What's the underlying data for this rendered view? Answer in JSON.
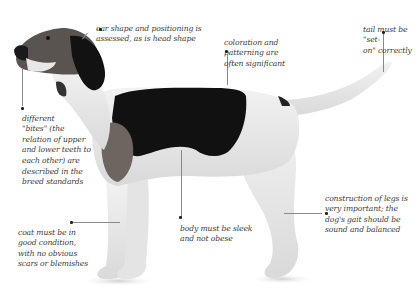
{
  "image": {
    "subject": "hound dog in profile, black-and-white tricolor coat, with breed-standard annotations",
    "background": "#ffffff"
  },
  "annotations": [
    {
      "id": "ear-shape",
      "text": "ear shape and positioning is\nassessed, as is head shape"
    },
    {
      "id": "coloration",
      "text": "coloration and\npatterning are\noften significant"
    },
    {
      "id": "tail",
      "text": "tail must be \"set-\non\" correctly"
    },
    {
      "id": "bites",
      "text": "different\n\"bites\" (the\nrelation of upper\nand lower teeth to\neach other) are\ndescribed in the\nbreed standards"
    },
    {
      "id": "coat",
      "text": "coat must be in\ngood condition,\nwith no obvious\nscars or blemishes"
    },
    {
      "id": "body",
      "text": "body must be sleek\nand not obese"
    },
    {
      "id": "legs",
      "text": "construction of legs is\nvery important; the\ndog's gait should be\nsound and balanced"
    }
  ],
  "colors": {
    "text": "#3a3a3a",
    "leader_line": "#8a8a8a",
    "dot": "#222222",
    "coat_black": "#111111",
    "coat_white": "#ececec",
    "coat_tan": "#6e6560"
  }
}
